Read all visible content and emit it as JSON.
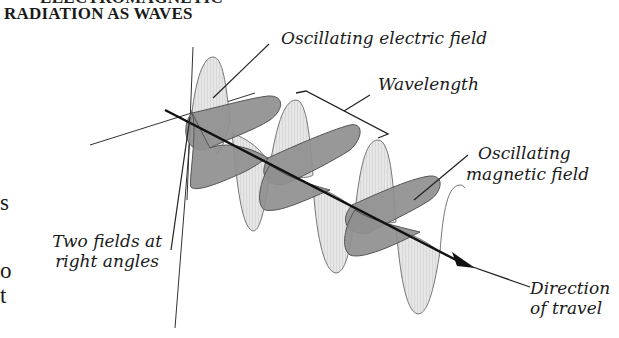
{
  "page": {
    "partial_heading_top": "ELECTROMAGNETIC",
    "section_title": "RADIATION AS WAVES",
    "left_margin_fragments": [
      "s",
      "o",
      "t"
    ]
  },
  "diagram": {
    "labels": {
      "electric_field": "Oscillating electric field",
      "wavelength": "Wavelength",
      "magnetic_field_line1": "Oscillating",
      "magnetic_field_line2": "magnetic field",
      "right_angles_line1": "Two fields at",
      "right_angles_line2": "right angles",
      "direction_line1": "Direction",
      "direction_line2": "of travel"
    },
    "colors": {
      "electric_lobe_fill": "#e4e4e4",
      "magnetic_lobe_fill": "#8e8e8e",
      "axis": "#111111",
      "leader_line": "#222222"
    }
  }
}
